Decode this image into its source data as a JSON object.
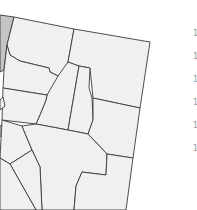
{
  "map": {
    "region": "Nevada counties (partial, rotated view)",
    "colors": {
      "county_fill": "#f0f0f0",
      "highlighted_fill": "#c4c4c4",
      "border": "#3a3a3a",
      "background": "#ffffff"
    }
  },
  "legend": {
    "items": [
      {
        "label": "1"
      },
      {
        "label": "1"
      },
      {
        "label": "1"
      },
      {
        "label": "1"
      },
      {
        "label": "1"
      },
      {
        "label": "1"
      }
    ]
  }
}
